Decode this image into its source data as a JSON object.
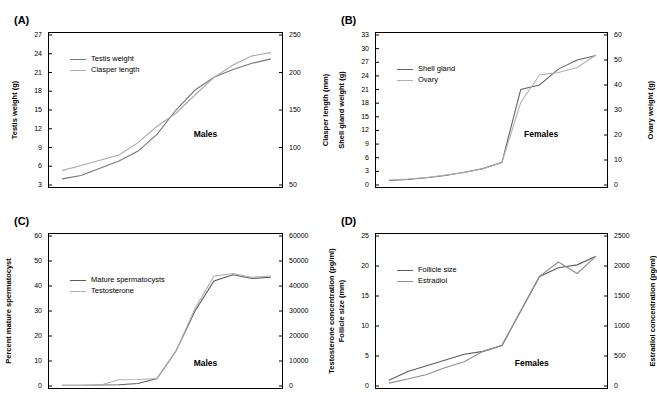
{
  "figure": {
    "panels": [
      {
        "tag": "(A)",
        "group_label": "Males",
        "left_axis_title": "Testis weight (g)",
        "right_axis_title": "Clasper length (mm)",
        "left_ticks": [
          "3",
          "6",
          "9",
          "12",
          "15",
          "18",
          "21",
          "24",
          "27"
        ],
        "right_ticks": [
          "50",
          "100",
          "150",
          "200",
          "250"
        ],
        "legend": [
          {
            "label": "Testis weight",
            "color": "#777777"
          },
          {
            "label": "Clasper length",
            "color": "#aaaaaa"
          }
        ]
      },
      {
        "tag": "(B)",
        "group_label": "Females",
        "left_axis_title": "Shell gland weight (g)",
        "right_axis_title": "Ovary weight (g)",
        "left_ticks": [
          "0",
          "3",
          "6",
          "9",
          "12",
          "15",
          "18",
          "21",
          "24",
          "27",
          "30",
          "33"
        ],
        "right_ticks": [
          "0",
          "10",
          "20",
          "30",
          "40",
          "50",
          "60"
        ],
        "legend": [
          {
            "label": "Shell gland",
            "color": "#666666"
          },
          {
            "label": "Ovary",
            "color": "#b0b0b0"
          }
        ]
      },
      {
        "tag": "(C)",
        "group_label": "Males",
        "left_axis_title": "Percent mature spermatocyst",
        "right_axis_title": "Testosterone concentration (pg/ml)",
        "left_ticks": [
          "0",
          "10",
          "20",
          "30",
          "40",
          "50",
          "60"
        ],
        "right_ticks": [
          "0",
          "10000",
          "20000",
          "30000",
          "40000",
          "50000",
          "60000"
        ],
        "legend": [
          {
            "label": "Mature spermatocysts",
            "color": "#5b5b5b"
          },
          {
            "label": "Testosterone",
            "color": "#b0b0b0"
          }
        ]
      },
      {
        "tag": "(D)",
        "group_label": "Females",
        "left_axis_title": "Follicle size (mm)",
        "right_axis_title": "Estradiol concentration (pg/ml)",
        "left_ticks": [
          "0",
          "5",
          "10",
          "15",
          "20",
          "25"
        ],
        "right_ticks": [
          "0",
          "500",
          "1000",
          "1500",
          "2000",
          "2500"
        ],
        "legend": [
          {
            "label": "Follicle size",
            "color": "#5b5b5b"
          },
          {
            "label": "Estradiol",
            "color": "#8f8f8f"
          }
        ]
      }
    ]
  },
  "chart_data": [
    {
      "type": "line",
      "title": "(A)",
      "annotation": "Males",
      "xlabel": "",
      "ylabel": "Testis weight (g)",
      "y2label": "Clasper length (mm)",
      "ylim": [
        1.5,
        28.5
      ],
      "y2lim": [
        40,
        270
      ],
      "grid": false,
      "legend_position": "top-left",
      "x": [
        1,
        2,
        3,
        4,
        5,
        6,
        7,
        8,
        9,
        10,
        11,
        12
      ],
      "series": [
        {
          "name": "Testis weight",
          "axis": "left",
          "color": "#777777",
          "values": [
            2.6,
            3.2,
            4.5,
            5.8,
            7.6,
            10.6,
            15.0,
            18.6,
            20.9,
            22.3,
            23.4,
            24.2
          ]
        },
        {
          "name": "Clasper length",
          "axis": "right",
          "color": "#aaaaaa",
          "values": [
            62,
            70,
            78,
            86,
            105,
            130,
            150,
            178,
            205,
            224,
            238,
            243
          ]
        }
      ]
    },
    {
      "type": "line",
      "title": "(B)",
      "annotation": "Females",
      "xlabel": "",
      "ylabel": "Shell gland weight (g)",
      "y2label": "Ovary weight (g)",
      "ylim": [
        0,
        33
      ],
      "y2lim": [
        0,
        60
      ],
      "grid": false,
      "legend_position": "top-left",
      "x": [
        1,
        2,
        3,
        4,
        5,
        6,
        7,
        8,
        9,
        10,
        11,
        12
      ],
      "series": [
        {
          "name": "Shell gland",
          "axis": "left",
          "color": "#666666",
          "values": [
            1.0,
            1.2,
            1.6,
            2.1,
            2.8,
            3.6,
            5.0,
            21.0,
            22.0,
            25.5,
            27.5,
            28.5
          ]
        },
        {
          "name": "Ovary",
          "axis": "right",
          "color": "#b0b0b0",
          "values": [
            2.0,
            2.4,
            3.0,
            4.0,
            5.0,
            6.5,
            9.0,
            33.0,
            44.0,
            45.0,
            47.0,
            52.0
          ]
        }
      ]
    },
    {
      "type": "line",
      "title": "(C)",
      "annotation": "Males",
      "xlabel": "",
      "ylabel": "Percent mature spermatocyst",
      "y2label": "Testosterone concentration (pg/ml)",
      "ylim": [
        0,
        60
      ],
      "y2lim": [
        0,
        60000
      ],
      "grid": false,
      "legend_position": "top-left",
      "x": [
        1,
        2,
        3,
        4,
        5,
        6,
        7,
        8,
        9,
        10,
        11,
        12
      ],
      "series": [
        {
          "name": "Mature spermatocysts",
          "axis": "left",
          "color": "#5b5b5b",
          "values": [
            0.3,
            0.3,
            0.4,
            0.5,
            1.0,
            3.0,
            14.0,
            30.0,
            42.0,
            44.5,
            43.0,
            43.5
          ]
        },
        {
          "name": "Testosterone",
          "axis": "right",
          "color": "#b0b0b0",
          "values": [
            200,
            200,
            300,
            2500,
            2600,
            3000,
            14000,
            31000,
            44000,
            45000,
            43500,
            44000
          ]
        }
      ]
    },
    {
      "type": "line",
      "title": "(D)",
      "annotation": "Females",
      "xlabel": "",
      "ylabel": "Follicle size (mm)",
      "y2label": "Estradiol concentration (pg/ml)",
      "ylim": [
        0,
        26
      ],
      "y2lim": [
        0,
        2600
      ],
      "grid": false,
      "legend_position": "top-left",
      "x": [
        1,
        2,
        3,
        4,
        5,
        6,
        7,
        8,
        9,
        10,
        11,
        12
      ],
      "series": [
        {
          "name": "Follicle size",
          "axis": "left",
          "color": "#5b5b5b",
          "values": [
            1.0,
            2.5,
            3.5,
            4.5,
            5.5,
            6.0,
            7.0,
            13.0,
            19.0,
            20.5,
            21.0,
            22.5
          ]
        },
        {
          "name": "Estradiol",
          "axis": "right",
          "color": "#8f8f8f",
          "values": [
            50,
            120,
            200,
            320,
            420,
            600,
            700,
            1300,
            1900,
            2150,
            1950,
            2250
          ]
        }
      ]
    }
  ]
}
